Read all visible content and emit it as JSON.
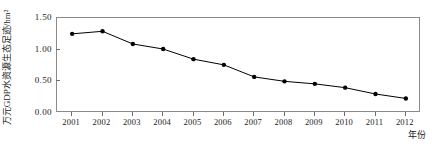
{
  "chart_data": {
    "type": "line",
    "title": "",
    "xlabel": "年份",
    "ylabel": "万元GDP水资源生态足迹/hm²",
    "categories": [
      "2001",
      "2002",
      "2003",
      "2004",
      "2005",
      "2006",
      "2007",
      "2008",
      "2009",
      "2010",
      "2011",
      "2012"
    ],
    "values": [
      1.25,
      1.29,
      1.09,
      1.01,
      0.85,
      0.76,
      0.57,
      0.5,
      0.46,
      0.4,
      0.3,
      0.23
    ],
    "series": [
      {
        "name": "万元GDP水资源生态足迹",
        "values": [
          1.25,
          1.29,
          1.09,
          1.01,
          0.85,
          0.76,
          0.57,
          0.5,
          0.46,
          0.4,
          0.3,
          0.23
        ],
        "marker": "filled-circle",
        "color": "#000000"
      }
    ],
    "ylim": [
      0.0,
      1.5
    ],
    "yticks": [
      0.0,
      0.5,
      1.0,
      1.5
    ],
    "ytick_labels": [
      "0.00",
      "0.50",
      "1.00",
      "1.50"
    ],
    "xticks": [
      "2001",
      "2002",
      "2003",
      "2004",
      "2005",
      "2006",
      "2007",
      "2008",
      "2009",
      "2010",
      "2011",
      "2012"
    ],
    "grid": false,
    "legend": false,
    "legend_position": "none",
    "line_color": "#000000",
    "marker_color": "#000000",
    "frame_color": "#8a8a8a",
    "background": "#ffffff"
  }
}
